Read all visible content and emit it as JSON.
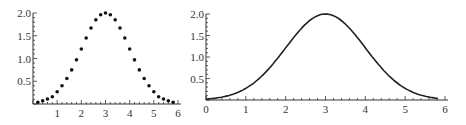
{
  "chart_data": [
    {
      "type": "scatter",
      "title": "",
      "xlabel": "",
      "ylabel": "",
      "function": "y = 2*exp(-(x-3)^2/2)",
      "xlim": [
        0,
        6
      ],
      "ylim": [
        0,
        2.0
      ],
      "x_ticks": [
        "1",
        "2",
        "3",
        "4",
        "5",
        "6"
      ],
      "y_ticks": [
        "0.5",
        "1.0",
        "1.5",
        "2.0"
      ],
      "grid": false,
      "marker": "dots",
      "series": [
        {
          "name": "points",
          "x": [
            0.2,
            0.4,
            0.6,
            0.8,
            1.0,
            1.2,
            1.4,
            1.6,
            1.8,
            2.0,
            2.2,
            2.4,
            2.6,
            2.8,
            3.0,
            3.2,
            3.4,
            3.6,
            3.8,
            4.0,
            4.2,
            4.4,
            4.6,
            4.8,
            5.0,
            5.2,
            5.4,
            5.6,
            5.8
          ],
          "y": [
            0.04,
            0.07,
            0.11,
            0.16,
            0.27,
            0.4,
            0.56,
            0.75,
            0.97,
            1.21,
            1.45,
            1.67,
            1.85,
            1.96,
            2.0,
            1.96,
            1.85,
            1.67,
            1.45,
            1.21,
            0.97,
            0.75,
            0.56,
            0.4,
            0.27,
            0.16,
            0.11,
            0.07,
            0.04
          ]
        }
      ]
    },
    {
      "type": "line",
      "title": "",
      "xlabel": "",
      "ylabel": "",
      "function": "y = 2*exp(-(x-3)^2/2)",
      "xlim": [
        0,
        6
      ],
      "ylim": [
        0,
        2.0
      ],
      "x_ticks": [
        "0",
        "1",
        "2",
        "3",
        "4",
        "5",
        "6"
      ],
      "y_ticks": [
        "0.5",
        "1.0",
        "1.5",
        "2.0"
      ],
      "grid": false,
      "series": [
        {
          "name": "curve",
          "x": [
            0,
            0.5,
            1,
            1.5,
            2,
            2.5,
            3,
            3.5,
            4,
            4.5,
            5,
            5.5,
            6
          ],
          "y": [
            0.02,
            0.09,
            0.27,
            0.65,
            1.21,
            1.76,
            2.0,
            1.76,
            1.21,
            0.65,
            0.27,
            0.09,
            0.02
          ]
        }
      ]
    }
  ]
}
